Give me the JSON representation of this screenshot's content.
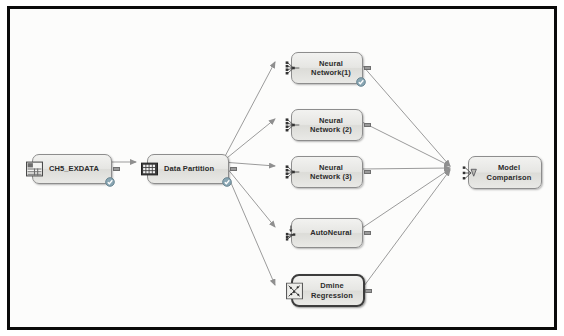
{
  "diagram": {
    "canvas_background": "#fcfcfb",
    "frame_color": "#0a0a0a",
    "wire_color": "#9b9b9b",
    "badge_color": "#7f9ba8"
  },
  "nodes": [
    {
      "id": "data-source",
      "label": "CH5_EXDATA",
      "icon": "table-icon",
      "x": 22,
      "y": 145,
      "w": 80,
      "h": 30,
      "label_align": "left",
      "has_badge": true,
      "has_out_port": true,
      "selected": false
    },
    {
      "id": "data-partition",
      "label": "Data Partition",
      "icon": "data-partition-icon",
      "x": 137,
      "y": 145,
      "w": 82,
      "h": 30,
      "label_align": "left",
      "has_badge": true,
      "has_out_port": true,
      "selected": false
    },
    {
      "id": "neural-network-1",
      "label": "Neural\nNetwork(1)",
      "icon": "neural-network-icon",
      "x": 281,
      "y": 43,
      "w": 72,
      "h": 32,
      "label_align": "center",
      "has_badge": true,
      "has_out_port": true,
      "selected": false
    },
    {
      "id": "neural-network-2",
      "label": "Neural\nNetwork (2)",
      "icon": "neural-network-icon",
      "x": 281,
      "y": 100,
      "w": 72,
      "h": 32,
      "label_align": "center",
      "has_badge": false,
      "has_out_port": true,
      "selected": false
    },
    {
      "id": "neural-network-3",
      "label": "Neural\nNetwork (3)",
      "icon": "neural-network-icon",
      "x": 281,
      "y": 147,
      "w": 72,
      "h": 32,
      "label_align": "center",
      "has_badge": false,
      "has_out_port": true,
      "selected": false
    },
    {
      "id": "autoneural",
      "label": "AutoNeural",
      "icon": "autoneural-icon",
      "x": 281,
      "y": 209,
      "w": 72,
      "h": 30,
      "label_align": "center",
      "has_badge": false,
      "has_out_port": true,
      "selected": false
    },
    {
      "id": "dmine-regression",
      "label": "Dmine\nRegression",
      "icon": "dmine-regression-icon",
      "x": 281,
      "y": 265,
      "w": 74,
      "h": 33,
      "label_align": "center",
      "has_badge": false,
      "has_out_port": true,
      "selected": true
    },
    {
      "id": "model-comparison",
      "label": "Model\nComparison",
      "icon": "model-comparison-icon",
      "x": 458,
      "y": 147,
      "w": 74,
      "h": 33,
      "label_align": "center",
      "has_badge": false,
      "has_out_port": false,
      "selected": false
    }
  ],
  "edges": [
    {
      "from": "data-source",
      "to": "data-partition"
    },
    {
      "from": "data-partition",
      "to": "neural-network-1"
    },
    {
      "from": "data-partition",
      "to": "neural-network-2"
    },
    {
      "from": "data-partition",
      "to": "neural-network-3"
    },
    {
      "from": "data-partition",
      "to": "autoneural"
    },
    {
      "from": "data-partition",
      "to": "dmine-regression"
    },
    {
      "from": "neural-network-1",
      "to": "model-comparison"
    },
    {
      "from": "neural-network-2",
      "to": "model-comparison"
    },
    {
      "from": "neural-network-3",
      "to": "model-comparison"
    },
    {
      "from": "autoneural",
      "to": "model-comparison"
    },
    {
      "from": "dmine-regression",
      "to": "model-comparison"
    }
  ]
}
